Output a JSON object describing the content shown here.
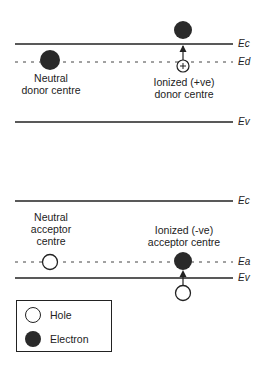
{
  "diagram": {
    "donor_panel": {
      "levels": [
        {
          "label": "Ec",
          "style": "solid"
        },
        {
          "label": "Ed",
          "style": "dashed"
        },
        {
          "label": "Ev",
          "style": "solid"
        }
      ],
      "neutral_label_line1": "Neutral",
      "neutral_label_line2": "donor centre",
      "ionized_label_line1": "Ionized (+ve)",
      "ionized_label_line2": "donor centre",
      "ionized_symbol": "+"
    },
    "acceptor_panel": {
      "levels": [
        {
          "label": "Ec",
          "style": "solid"
        },
        {
          "label": "Ea",
          "style": "dashed"
        },
        {
          "label": "Ev",
          "style": "solid"
        }
      ],
      "neutral_label_line1": "Neutral",
      "neutral_label_line2": "acceptor",
      "neutral_label_line3": "centre",
      "ionized_label_line1": "Ionized (-ve)",
      "ionized_label_line2": "acceptor centre"
    },
    "legend": {
      "items": [
        {
          "symbol": "open-circle",
          "label": "Hole"
        },
        {
          "symbol": "filled-circle",
          "label": "Electron"
        }
      ]
    },
    "colors": {
      "line": "#222222",
      "electron": "#2a2a2a",
      "hole_fill": "#ffffff"
    }
  }
}
